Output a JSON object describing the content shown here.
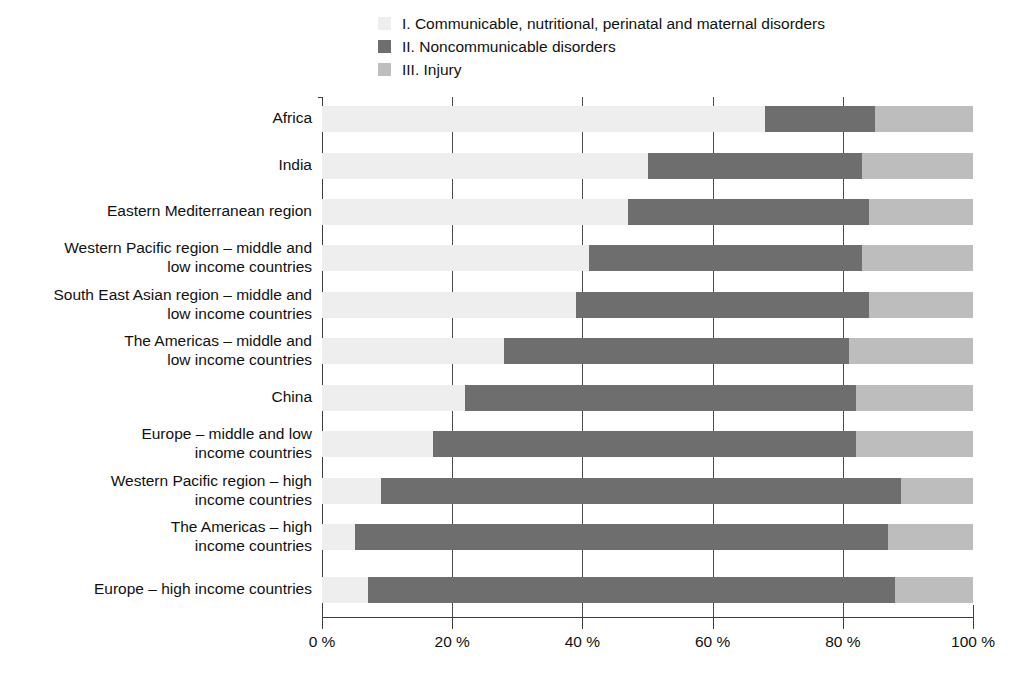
{
  "chart_data": {
    "type": "bar",
    "orientation": "horizontal",
    "stacked": true,
    "title": "",
    "xlabel": "",
    "ylabel": "",
    "xlim": [
      0,
      100
    ],
    "grid": true,
    "legend_position": "top",
    "tick_labels": [
      "0 %",
      "20 %",
      "40 %",
      "60 %",
      "80 %",
      "100 %"
    ],
    "ticks": [
      0,
      20,
      40,
      60,
      80,
      100
    ],
    "legend": [
      {
        "key": "I",
        "label": "I. Communicable, nutritional, perinatal and maternal disorders",
        "color": "#eeeeee"
      },
      {
        "key": "II",
        "label": "II. Noncommunicable disorders",
        "color": "#6e6e6e"
      },
      {
        "key": "III",
        "label": "III. Injury",
        "color": "#bdbdbd"
      }
    ],
    "categories": [
      "Africa",
      "India",
      "Eastern Mediterranean region",
      "Western Pacific region – middle and\nlow income countries",
      "South East Asian region – middle and\nlow income countries",
      "The Americas – middle and\nlow income countries",
      "China",
      "Europe – middle and low\nincome countries",
      "Western Pacific region – high\nincome countries",
      "The Americas – high\nincome countries",
      "Europe – high income countries"
    ],
    "series": [
      {
        "name": "I. Communicable, nutritional, perinatal and maternal disorders",
        "color": "#eeeeee",
        "values": [
          68,
          50,
          47,
          41,
          39,
          28,
          22,
          17,
          9,
          5,
          7
        ]
      },
      {
        "name": "II. Noncommunicable disorders",
        "color": "#6e6e6e",
        "values": [
          17,
          33,
          37,
          42,
          45,
          53,
          60,
          65,
          80,
          82,
          81
        ]
      },
      {
        "name": "III. Injury",
        "color": "#bdbdbd",
        "values": [
          15,
          17,
          16,
          17,
          16,
          19,
          18,
          18,
          11,
          13,
          12
        ]
      }
    ]
  }
}
